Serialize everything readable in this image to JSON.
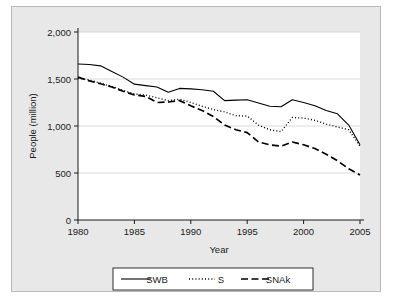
{
  "chart_data": {
    "type": "line",
    "title": "",
    "xlabel": "Year",
    "ylabel": "People (million)",
    "xlim": [
      1980,
      2005
    ],
    "ylim": [
      0,
      2000
    ],
    "xticks": [
      1980,
      1985,
      1990,
      1995,
      2000,
      2005
    ],
    "xticklabels": [
      "1980",
      "1985",
      "1990",
      "1995",
      "2000",
      "2005"
    ],
    "yticks": [
      0,
      500,
      1000,
      1500,
      2000
    ],
    "yticklabels": [
      "0",
      "500",
      "1,000",
      "1,500",
      "2,000"
    ],
    "grid": "horizontal",
    "legend_position": "bottom",
    "x": [
      1980,
      1981,
      1982,
      1983,
      1984,
      1985,
      1986,
      1987,
      1988,
      1989,
      1990,
      1991,
      1992,
      1993,
      1994,
      1995,
      1996,
      1997,
      1998,
      1999,
      2000,
      2001,
      2002,
      2003,
      2004,
      2005
    ],
    "series": [
      {
        "name": "SWB",
        "style": "solid",
        "color": "#000000",
        "values": [
          1660,
          1655,
          1640,
          1580,
          1520,
          1445,
          1430,
          1415,
          1360,
          1400,
          1395,
          1385,
          1370,
          1270,
          1275,
          1280,
          1245,
          1210,
          1205,
          1280,
          1250,
          1215,
          1165,
          1130,
          1010,
          800
        ]
      },
      {
        "name": "S",
        "style": "dotted",
        "color": "#000000",
        "values": [
          1510,
          1490,
          1455,
          1420,
          1380,
          1340,
          1330,
          1300,
          1270,
          1285,
          1250,
          1210,
          1175,
          1150,
          1110,
          1105,
          1010,
          960,
          940,
          1090,
          1085,
          1060,
          1020,
          990,
          960,
          785
        ]
      },
      {
        "name": "SNAk",
        "style": "dashed",
        "color": "#000000",
        "values": [
          1520,
          1480,
          1450,
          1415,
          1370,
          1330,
          1315,
          1250,
          1255,
          1270,
          1215,
          1165,
          1100,
          1010,
          960,
          930,
          830,
          800,
          785,
          830,
          800,
          760,
          700,
          630,
          545,
          480
        ]
      }
    ]
  },
  "legend": {
    "items": [
      {
        "label": "SWB",
        "style": "solid"
      },
      {
        "label": "S",
        "style": "dotted"
      },
      {
        "label": "SNAk",
        "style": "dashed"
      }
    ]
  }
}
